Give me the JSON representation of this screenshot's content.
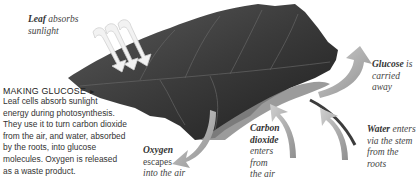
{
  "diagram": {
    "title": "MAKING GLUCOSE",
    "title_marker": "►",
    "description_lines": [
      "Leaf cells absorb sunlight",
      "energy during photosynthesis.",
      "They use it to turn carbon dioxide",
      "from the air, and water, absorbed",
      "by the roots, into glucose",
      "molecules. Oxygen is released",
      "as a waste product."
    ],
    "labels": {
      "sunlight": {
        "bold": "Leaf",
        "rest": " absorbs",
        "line2": "sunlight"
      },
      "glucose": {
        "bold": "Glucose",
        "rest": " is",
        "line2": "carried",
        "line3": "away"
      },
      "oxygen": {
        "bold": "Oxygen",
        "line2": "escapes",
        "line3": "into the air"
      },
      "carbon_dioxide": {
        "bold1": "Carbon",
        "bold2": "dioxide",
        "line3": "enters",
        "line4": "from",
        "line5": "the air"
      },
      "water": {
        "bold": "Water",
        "rest": " enters",
        "line2": "via the stem",
        "line3": "from the",
        "line4": "roots"
      }
    },
    "colors": {
      "leaf_dark": "#2e2e2e",
      "leaf_mid": "#555555",
      "arrow_gray": "#a8a8a8",
      "sunlight_arrow": "#eeeeee",
      "text": "#333333"
    }
  }
}
